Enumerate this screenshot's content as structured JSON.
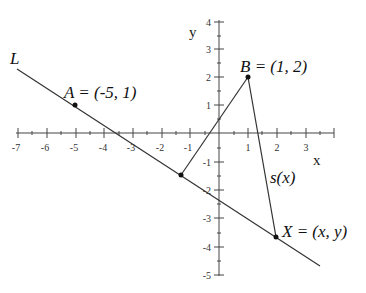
{
  "diagram": {
    "axes": {
      "x_label": "x",
      "y_label": "y",
      "x_ticks": [
        "-7",
        "-6",
        "-5",
        "-4",
        "-3",
        "-2",
        "-1",
        "1",
        "2",
        "3"
      ],
      "y_ticks": [
        "4",
        "3",
        "2",
        "1",
        "-1",
        "-2",
        "-3",
        "-4",
        "-5"
      ],
      "x_range": [
        -7,
        3
      ],
      "y_range": [
        -5,
        4
      ]
    },
    "line_label": "L",
    "points": {
      "A": {
        "label": "A = (-5, 1)",
        "x": -5,
        "y": 1
      },
      "B": {
        "label": "B = (1, 2)",
        "x": 1,
        "y": 2
      },
      "X": {
        "label": "X = (x, y)",
        "x": 2,
        "y": -3.65
      },
      "P": {
        "label": "",
        "x": -1.32,
        "y": -1.47
      }
    },
    "segment_label": "s(x)",
    "colors": {
      "stroke": "#333333",
      "point": "#111111"
    }
  }
}
